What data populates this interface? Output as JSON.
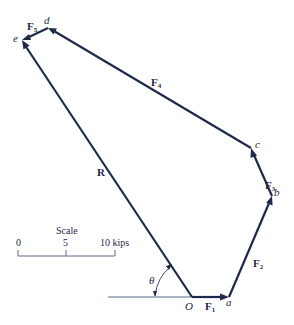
{
  "diagram": {
    "type": "vector-polygon",
    "points": {
      "O": {
        "label": "O",
        "x": 192,
        "y": 297
      },
      "a": {
        "label": "a",
        "x": 229,
        "y": 297
      },
      "b": {
        "label": "b",
        "x": 272,
        "y": 196
      },
      "c": {
        "label": "c",
        "x": 251,
        "y": 148
      },
      "d": {
        "label": "d",
        "x": 48,
        "y": 28
      },
      "e": {
        "label": "e",
        "x": 22,
        "y": 40
      }
    },
    "vectors": [
      {
        "name": "F",
        "sub": "1",
        "from": "O",
        "to": "a"
      },
      {
        "name": "F",
        "sub": "2",
        "from": "a",
        "to": "b"
      },
      {
        "name": "F",
        "sub": "3",
        "from": "b",
        "to": "c"
      },
      {
        "name": "F",
        "sub": "4",
        "from": "c",
        "to": "d"
      },
      {
        "name": "F",
        "sub": "5",
        "from": "d",
        "to": "e"
      },
      {
        "name": "R",
        "sub": "",
        "from": "O",
        "to": "e"
      }
    ],
    "angle": {
      "label": "θ",
      "between": "horizontal reference and R"
    },
    "scale": {
      "title": "Scale",
      "ticks": [
        "0",
        "5",
        "10 kips"
      ]
    }
  }
}
